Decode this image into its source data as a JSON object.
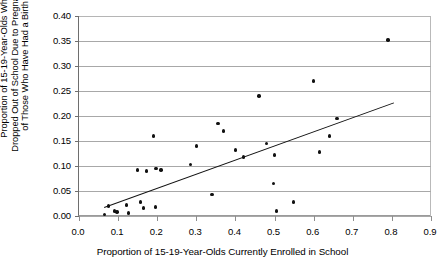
{
  "chart_data": {
    "type": "scatter",
    "title": "",
    "xlabel": "Proportion of 15-19-Year-Olds Currently Enrolled in School",
    "ylabel": "Proportion of 15-19-Year-Olds Who Dropped Out of School Due to Pregnancy, of Those Who Have Had a Birth",
    "ylabel_lines": [
      "Proportion of 15-19-Year-Olds Who",
      "Dropped Out of School Due to Pregnancy,",
      "of Those Who Have Had a Birth"
    ],
    "xlim": [
      0.0,
      0.9
    ],
    "ylim": [
      0.0,
      0.4
    ],
    "xticks": [
      0.0,
      0.1,
      0.2,
      0.3,
      0.4,
      0.5,
      0.6,
      0.7,
      0.8,
      0.9
    ],
    "xtick_labels": [
      "0.0",
      "0.1",
      "0.2",
      "0.3",
      "0.4",
      "0.5",
      "0.6",
      "0.7",
      "0.8",
      "0.9"
    ],
    "yticks": [
      0.0,
      0.05,
      0.1,
      0.15,
      0.2,
      0.25,
      0.3,
      0.35,
      0.4
    ],
    "ytick_labels": [
      "0.00",
      "0.05",
      "0.10",
      "0.15",
      "0.20",
      "0.25",
      "0.30",
      "0.35",
      "0.40"
    ],
    "grid": "horizontal",
    "legend": "none",
    "marker_color": "#111111",
    "trendline_color": "#111111",
    "points": [
      {
        "x": 0.065,
        "y": 0.003
      },
      {
        "x": 0.075,
        "y": 0.02
      },
      {
        "x": 0.09,
        "y": 0.01
      },
      {
        "x": 0.097,
        "y": 0.008
      },
      {
        "x": 0.122,
        "y": 0.022
      },
      {
        "x": 0.127,
        "y": 0.006
      },
      {
        "x": 0.15,
        "y": 0.092
      },
      {
        "x": 0.158,
        "y": 0.028
      },
      {
        "x": 0.165,
        "y": 0.016
      },
      {
        "x": 0.173,
        "y": 0.09
      },
      {
        "x": 0.19,
        "y": 0.16
      },
      {
        "x": 0.196,
        "y": 0.018
      },
      {
        "x": 0.197,
        "y": 0.095
      },
      {
        "x": 0.21,
        "y": 0.092
      },
      {
        "x": 0.285,
        "y": 0.103
      },
      {
        "x": 0.3,
        "y": 0.14
      },
      {
        "x": 0.34,
        "y": 0.043
      },
      {
        "x": 0.355,
        "y": 0.185
      },
      {
        "x": 0.37,
        "y": 0.17
      },
      {
        "x": 0.4,
        "y": 0.132
      },
      {
        "x": 0.42,
        "y": 0.118
      },
      {
        "x": 0.46,
        "y": 0.24
      },
      {
        "x": 0.48,
        "y": 0.145
      },
      {
        "x": 0.497,
        "y": 0.065
      },
      {
        "x": 0.5,
        "y": 0.122
      },
      {
        "x": 0.505,
        "y": 0.01
      },
      {
        "x": 0.548,
        "y": 0.028
      },
      {
        "x": 0.6,
        "y": 0.27
      },
      {
        "x": 0.615,
        "y": 0.128
      },
      {
        "x": 0.64,
        "y": 0.16
      },
      {
        "x": 0.66,
        "y": 0.195
      },
      {
        "x": 0.79,
        "y": 0.352
      }
    ],
    "trendline": {
      "x0": 0.065,
      "y0": 0.018,
      "x1": 0.805,
      "y1": 0.227
    }
  }
}
